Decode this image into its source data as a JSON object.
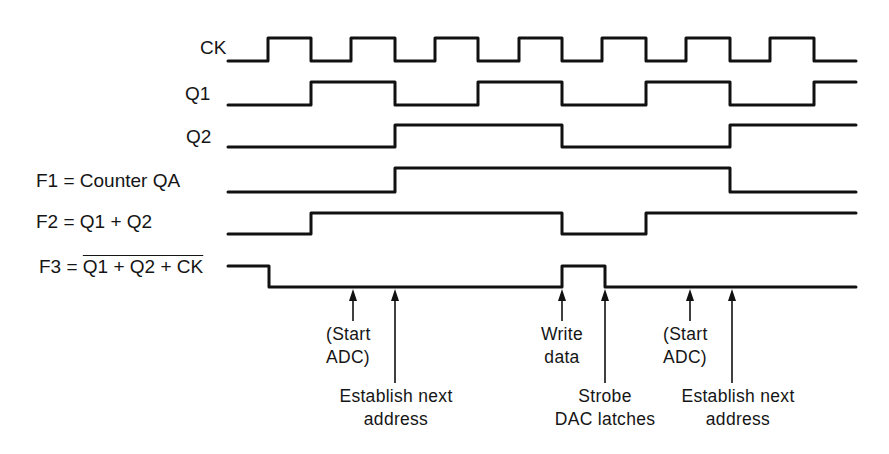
{
  "diagram": {
    "colors": {
      "line": "#111111",
      "background": "#ffffff"
    },
    "signals": [
      {
        "id": "ck",
        "label": "CK",
        "low_y": 61,
        "high_y": 38,
        "start": "low",
        "edges": [
          268,
          311,
          351,
          395,
          435,
          478,
          519,
          562,
          602,
          646,
          686,
          730,
          770,
          814
        ],
        "end_x": 856
      },
      {
        "id": "q1",
        "label": "Q1",
        "low_y": 105,
        "high_y": 82,
        "start": "low",
        "edges": [
          311,
          395,
          478,
          562,
          646,
          730,
          814
        ],
        "end_x": 856
      },
      {
        "id": "q2",
        "label": "Q2",
        "low_y": 147,
        "high_y": 125,
        "start": "low",
        "edges": [
          395,
          562,
          730
        ],
        "end_x": 856
      },
      {
        "id": "f1",
        "label": "F1 = Counter QA",
        "low_y": 192,
        "high_y": 168,
        "start": "low",
        "edges": [
          395,
          730
        ],
        "end_x": 856
      },
      {
        "id": "f2",
        "label": "F2 = Q1 + Q2",
        "low_y": 234,
        "high_y": 213,
        "start": "low",
        "edges": [
          311,
          562,
          646
        ],
        "end_x": 856
      },
      {
        "id": "f3",
        "label_prefix": "F3 = ",
        "label_overlined": "Q1 + Q2 + CK",
        "low_y": 287,
        "high_y": 266,
        "start": "high",
        "edges": [
          269,
          562,
          605
        ],
        "end_x": 856
      }
    ],
    "annotations": [
      {
        "id": "start-adc-1",
        "lines": [
          "(Start",
          "ADC)"
        ],
        "arrow_x": 353,
        "arrow_bottom": 321
      },
      {
        "id": "establish-next-address-1",
        "lines": [
          "Establish next",
          "address"
        ],
        "arrow_x": 395,
        "arrow_bottom": 383
      },
      {
        "id": "write-data",
        "lines": [
          "Write",
          "data"
        ],
        "arrow_x": 562,
        "arrow_bottom": 321
      },
      {
        "id": "strobe-dac-latches",
        "lines": [
          "Strobe",
          "DAC latches"
        ],
        "arrow_x": 605,
        "arrow_bottom": 383
      },
      {
        "id": "start-adc-2",
        "lines": [
          "(Start",
          "ADC)"
        ],
        "arrow_x": 690,
        "arrow_bottom": 321
      },
      {
        "id": "establish-next-address-2",
        "lines": [
          "Establish next",
          "address"
        ],
        "arrow_x": 732,
        "arrow_bottom": 383
      }
    ]
  }
}
